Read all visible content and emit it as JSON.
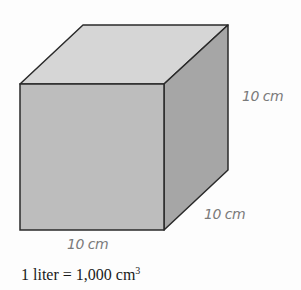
{
  "figure": {
    "shape": "cube",
    "labels": {
      "height": "10 cm",
      "depth": "10 cm",
      "width": "10 cm"
    },
    "caption": {
      "prefix": "1 liter = 1,000 cm",
      "superscript": "3"
    },
    "colors": {
      "front": "#bdbdbd",
      "top": "#d6d6d6",
      "side": "#a6a6a6",
      "edge": "#2a2a2a",
      "label": "#7a7a7a"
    }
  }
}
